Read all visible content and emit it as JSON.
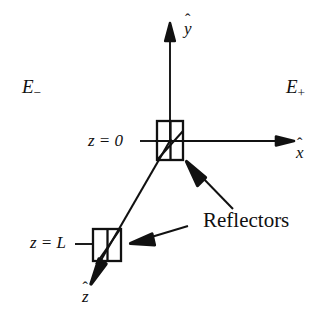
{
  "figure": {
    "background_color": "#ffffff",
    "line_color": "#111111",
    "width": 332,
    "height": 311
  },
  "axes": {
    "x": {
      "label_base": "x",
      "hat": "ˆ",
      "label_name": "x-hat",
      "direction": "right",
      "origin_px": [
        170,
        141
      ],
      "tip_px": [
        292,
        141
      ]
    },
    "y": {
      "label_base": "y",
      "hat": "ˆ",
      "label_name": "y-hat",
      "direction": "up",
      "origin_px": [
        170,
        141
      ],
      "tip_px": [
        170,
        24
      ]
    },
    "z": {
      "label_base": "z",
      "hat": "ˆ",
      "label_name": "z-hat",
      "direction": "down-left",
      "origin_px": [
        170,
        141
      ],
      "tip_px": [
        90,
        284
      ]
    }
  },
  "fields": {
    "left": {
      "base": "E",
      "sub": "−",
      "full": "E−"
    },
    "right": {
      "base": "E",
      "sub": "+",
      "full": "E+"
    }
  },
  "positions": {
    "top": {
      "base": "z",
      "eq": "=",
      "value": "0",
      "full": "z = 0"
    },
    "bottom": {
      "base": "z",
      "eq": "=",
      "value": "L",
      "full": "z = L"
    }
  },
  "callout": {
    "label": "Reflectors",
    "arrows": [
      {
        "name": "reflector-arrow-upper",
        "from_px": [
          233,
          209
        ],
        "to_px": [
          187,
          161
        ]
      },
      {
        "name": "reflector-arrow-lower",
        "from_px": [
          187,
          226
        ],
        "to_px": [
          131,
          243
        ]
      }
    ]
  },
  "reflectors": [
    {
      "name": "reflector-top",
      "position_label": "z = 0",
      "box_px": {
        "x": 157,
        "y": 121,
        "w": 26,
        "h": 39
      },
      "divider_x_px": 170,
      "diagonal": "bottom-left-to-top-right"
    },
    {
      "name": "reflector-bottom",
      "position_label": "z = L",
      "box_px": {
        "x": 93,
        "y": 229,
        "w": 28,
        "h": 32
      },
      "divider_x_px": 107,
      "diagonal": "bottom-left-to-top-right"
    }
  ]
}
